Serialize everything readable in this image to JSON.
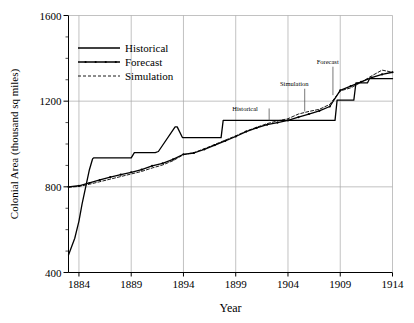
{
  "chart_data": {
    "type": "line",
    "title": "",
    "xlabel": "Year",
    "ylabel": "Colonial Area (thousand sq miles)",
    "xlim": [
      1883,
      1914
    ],
    "ylim": [
      400,
      1600
    ],
    "xticks": [
      1884,
      1889,
      1894,
      1899,
      1904,
      1909,
      1914
    ],
    "xticklabels": [
      "1884",
      "1889",
      "1894",
      "1899",
      "1904",
      "1909",
      "1914"
    ],
    "yticks": [
      400,
      800,
      1200,
      1600
    ],
    "yticklabels": [
      "400",
      "800",
      "1200",
      "1600"
    ],
    "yminorticks": [
      500,
      600,
      700,
      900,
      1000,
      1100,
      1300,
      1400,
      1500
    ],
    "grid": true,
    "grid_color": "#a8a8a8",
    "axis_color": "#000000",
    "legend_position": "upper left",
    "series": [
      {
        "name": "Historical",
        "style": "solid",
        "color": "#000000",
        "marker": "none",
        "x": [
          1883.0,
          1883.6,
          1884.0,
          1884.3,
          1885.0,
          1885.3,
          1885.4,
          1889.0,
          1889.3,
          1891.3,
          1891.6,
          1893.2,
          1893.4,
          1893.9,
          1894.1,
          1897.6,
          1897.8,
          1904.7,
          1905.0,
          1908.5,
          1908.7,
          1910.3,
          1910.5,
          1911.6,
          1911.8,
          1914.0
        ],
        "y": [
          482,
          560,
          640,
          720,
          880,
          930,
          935,
          935,
          960,
          960,
          965,
          1080,
          1080,
          1030,
          1030,
          1030,
          1110,
          1110,
          1110,
          1110,
          1205,
          1205,
          1285,
          1285,
          1305,
          1305
        ]
      },
      {
        "name": "Forecast",
        "style": "solid",
        "color": "#000000",
        "marker": "dot",
        "x": [
          1883.0,
          1884.0,
          1885.0,
          1886.0,
          1887.0,
          1888.0,
          1889.0,
          1890.0,
          1891.0,
          1892.0,
          1893.0,
          1894.0,
          1895.0,
          1896.0,
          1897.0,
          1898.0,
          1899.0,
          1900.0,
          1901.0,
          1902.0,
          1903.0,
          1904.0,
          1905.0,
          1906.0,
          1907.0,
          1908.0,
          1909.0,
          1910.0,
          1911.0,
          1912.0,
          1913.0,
          1914.0
        ],
        "y": [
          800,
          805,
          818,
          832,
          845,
          857,
          868,
          880,
          898,
          910,
          928,
          952,
          958,
          975,
          995,
          1015,
          1035,
          1058,
          1075,
          1090,
          1100,
          1110,
          1125,
          1140,
          1155,
          1175,
          1250,
          1270,
          1290,
          1310,
          1325,
          1335
        ]
      },
      {
        "name": "Simulation",
        "style": "dashed",
        "color": "#000000",
        "marker": "none",
        "x": [
          1883.0,
          1884.0,
          1885.0,
          1886.0,
          1887.0,
          1888.0,
          1889.0,
          1890.0,
          1891.0,
          1892.0,
          1893.0,
          1894.0,
          1895.0,
          1896.0,
          1897.0,
          1898.0,
          1899.0,
          1900.0,
          1901.0,
          1902.0,
          1903.0,
          1904.0,
          1905.0,
          1906.0,
          1907.0,
          1908.0,
          1909.0,
          1910.0,
          1911.0,
          1912.0,
          1913.0,
          1914.0
        ],
        "y": [
          798,
          802,
          812,
          824,
          836,
          848,
          860,
          872,
          888,
          902,
          922,
          950,
          960,
          978,
          998,
          1018,
          1038,
          1060,
          1078,
          1095,
          1108,
          1118,
          1140,
          1152,
          1162,
          1185,
          1248,
          1262,
          1288,
          1318,
          1345,
          1335
        ]
      }
    ],
    "annotations": [
      {
        "text": "Historical",
        "x": 1899.9,
        "y": 1152,
        "leader": "horizontal",
        "to_x": 1902.2,
        "to_y": 1110
      },
      {
        "text": "Simulation",
        "x": 1904.6,
        "y": 1272,
        "leader": "vertical",
        "to_x": 1905.6,
        "to_y": 1152
      },
      {
        "text": "Forecast",
        "x": 1907.8,
        "y": 1375,
        "leader": "vertical",
        "to_x": 1908.3,
        "to_y": 1228
      }
    ]
  },
  "legend": {
    "items": [
      {
        "label": "Historical",
        "style": "solid",
        "marker": "none"
      },
      {
        "label": "Forecast",
        "style": "solid",
        "marker": "dot"
      },
      {
        "label": "Simulation",
        "style": "dashed",
        "marker": "none"
      }
    ]
  }
}
